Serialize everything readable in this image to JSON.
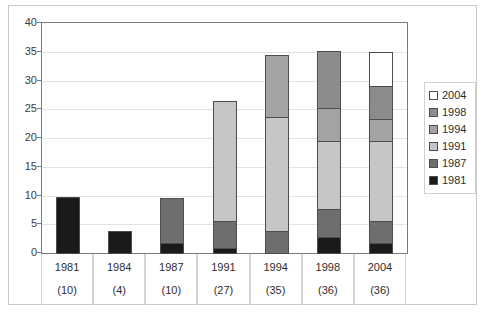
{
  "chart_data": {
    "type": "bar",
    "stacked": true,
    "title": "",
    "xlabel": "",
    "ylabel": "",
    "ylim": [
      0,
      40
    ],
    "yticks": [
      0,
      5,
      10,
      15,
      20,
      25,
      30,
      35,
      40
    ],
    "grid": true,
    "legend_position": "right",
    "categories": [
      "1981",
      "1984",
      "1987",
      "1991",
      "1994",
      "1998",
      "2004"
    ],
    "category_counts": [
      "(10)",
      "(4)",
      "(10)",
      "(27)",
      "(35)",
      "(36)",
      "(36)"
    ],
    "totals": [
      10,
      4,
      10,
      27,
      35,
      36,
      36
    ],
    "series": [
      {
        "name": "1981",
        "color": "#1a1a1a",
        "values": [
          10,
          4,
          2,
          1,
          0,
          3,
          2
        ]
      },
      {
        "name": "1987",
        "color": "#6e6e6e",
        "values": [
          0,
          0,
          8,
          5,
          4,
          5,
          4
        ]
      },
      {
        "name": "1991",
        "color": "#c6c6c6",
        "values": [
          0,
          0,
          0,
          21,
          20,
          12,
          14
        ]
      },
      {
        "name": "1994",
        "color": "#a3a3a3",
        "values": [
          0,
          0,
          0,
          0,
          11,
          6,
          4
        ]
      },
      {
        "name": "1998",
        "color": "#8c8c8c",
        "values": [
          0,
          0,
          0,
          0,
          0,
          10,
          6
        ]
      },
      {
        "name": "2004",
        "color": "#ffffff",
        "values": [
          0,
          0,
          0,
          0,
          0,
          0,
          6
        ]
      }
    ],
    "legend_entries": [
      {
        "label": "2004",
        "color": "#ffffff"
      },
      {
        "label": "1998",
        "color": "#8c8c8c"
      },
      {
        "label": "1994",
        "color": "#a3a3a3"
      },
      {
        "label": "1991",
        "color": "#c6c6c6"
      },
      {
        "label": "1987",
        "color": "#6e6e6e"
      },
      {
        "label": "1981",
        "color": "#1a1a1a"
      }
    ]
  }
}
